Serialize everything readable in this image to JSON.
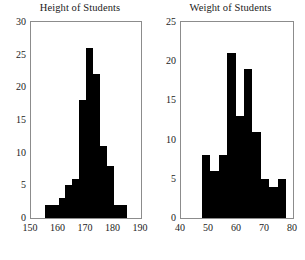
{
  "figure": {
    "background_color": "#ffffff",
    "bar_color": "#000000",
    "axis_color": "#8c8c8c",
    "text_color": "#1b1b1b"
  },
  "chart_data": [
    {
      "type": "bar",
      "title": "Height of Students",
      "xlabel": "",
      "ylabel": "",
      "xlim": [
        150,
        190
      ],
      "ylim": [
        0,
        30
      ],
      "xticks": [
        150,
        160,
        170,
        180,
        190
      ],
      "yticks": [
        0,
        5,
        10,
        15,
        20,
        25,
        30
      ],
      "grid": false,
      "legend": "none",
      "bin_width": 2.5,
      "bin_edges": [
        155,
        157.5,
        160,
        162.5,
        165,
        167.5,
        170,
        172.5,
        175,
        177.5,
        180,
        182.5,
        185
      ],
      "categories": [
        "155-157.5",
        "157.5-160",
        "160-162.5",
        "162.5-165",
        "165-167.5",
        "167.5-170",
        "170-172.5",
        "172.5-175",
        "175-177.5",
        "177.5-180",
        "180-182.5",
        "182.5-185"
      ],
      "values": [
        2,
        2,
        3,
        5,
        6,
        18,
        26,
        22,
        11,
        8,
        2,
        2
      ]
    },
    {
      "type": "bar",
      "title": "Weight of Students",
      "xlabel": "",
      "ylabel": "",
      "xlim": [
        40,
        80
      ],
      "ylim": [
        0,
        25
      ],
      "xticks": [
        40,
        50,
        60,
        70,
        80
      ],
      "yticks": [
        0,
        5,
        10,
        15,
        20,
        25
      ],
      "grid": false,
      "legend": "none",
      "bin_width": 3,
      "bin_edges": [
        47.5,
        50.5,
        53.5,
        56.5,
        59.5,
        62.5,
        65.5,
        68.5,
        71.5,
        74.5,
        77.5
      ],
      "categories": [
        "47.5-50.5",
        "50.5-53.5",
        "53.5-56.5",
        "56.5-59.5",
        "59.5-62.5",
        "62.5-65.5",
        "65.5-68.5",
        "68.5-71.5",
        "71.5-74.5",
        "74.5-77.5"
      ],
      "values": [
        8,
        6,
        8,
        21,
        13,
        19,
        11,
        5,
        4,
        5
      ]
    }
  ]
}
